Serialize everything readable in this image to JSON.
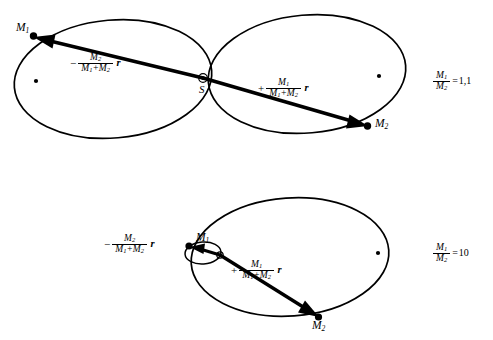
{
  "figure": {
    "background_color": "#ffffff",
    "stroke_color": "#000000"
  },
  "panels": [
    {
      "id": "top-panel",
      "mass_ratio": {
        "numerator": "M",
        "numerator_sub": "1",
        "denominator": "M",
        "denominator_sub": "2",
        "equals": "=",
        "value": "1,1"
      },
      "bodies": [
        {
          "name": "body-m1",
          "label": "M",
          "sub": "1"
        },
        {
          "name": "body-m2",
          "label": "M",
          "sub": "2"
        }
      ],
      "barycenter": {
        "name": "barycenter-s",
        "label": "S"
      },
      "vectors": [
        {
          "name": "vector-to-m1",
          "sign": "−",
          "num": "M",
          "num_sub": "2",
          "den_left": "M",
          "den_left_sub": "1",
          "den_plus": "+",
          "den_right": "M",
          "den_right_sub": "2",
          "r": "r"
        },
        {
          "name": "vector-to-m2",
          "sign": "+",
          "num": "M",
          "num_sub": "1",
          "den_left": "M",
          "den_left_sub": "1",
          "den_plus": "+",
          "den_right": "M",
          "den_right_sub": "2",
          "r": "r"
        }
      ]
    },
    {
      "id": "bottom-panel",
      "mass_ratio": {
        "numerator": "M",
        "numerator_sub": "1",
        "denominator": "M",
        "denominator_sub": "2",
        "equals": "=",
        "value": "10"
      },
      "bodies": [
        {
          "name": "body-m1",
          "label": "M",
          "sub": "1"
        },
        {
          "name": "body-m2",
          "label": "M",
          "sub": "2"
        }
      ],
      "vectors": [
        {
          "name": "vector-to-m1",
          "sign": "−",
          "num": "M",
          "num_sub": "2",
          "den_left": "M",
          "den_left_sub": "1",
          "den_plus": "+",
          "den_right": "M",
          "den_right_sub": "2",
          "r": "r"
        },
        {
          "name": "vector-to-m2",
          "sign": "+",
          "num": "M",
          "num_sub": "1",
          "den_left": "M",
          "den_left_sub": "1",
          "den_plus": "+",
          "den_right": "M",
          "den_right_sub": "2",
          "r": "r"
        }
      ]
    }
  ]
}
